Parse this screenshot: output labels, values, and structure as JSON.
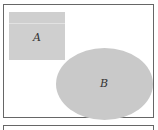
{
  "diagram": {
    "type": "venn",
    "universe": {
      "shape": "rectangle",
      "border_color": "#666666"
    },
    "sets": [
      {
        "label": "A",
        "shape": "rectangle",
        "fill": "#cfcfcf"
      },
      {
        "label": "B",
        "shape": "ellipse",
        "fill": "#c9c9c9"
      }
    ],
    "relation": "disjoint"
  }
}
